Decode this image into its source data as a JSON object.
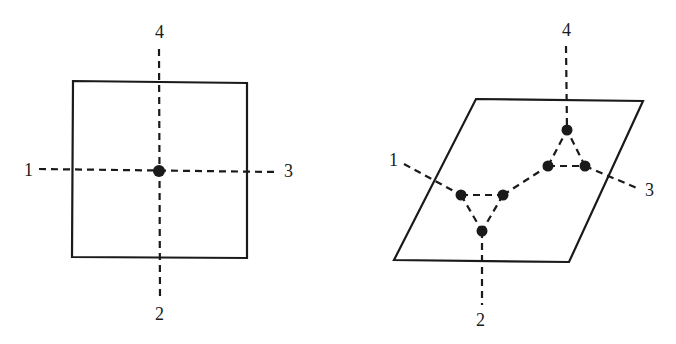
{
  "diagram": {
    "left": {
      "title": "square-with-single-junction",
      "labels": [
        {
          "text": "1",
          "x": 24,
          "y": 176
        },
        {
          "text": "2",
          "x": 155,
          "y": 320
        },
        {
          "text": "3",
          "x": 284,
          "y": 177
        },
        {
          "text": "4",
          "x": 155,
          "y": 38
        }
      ],
      "node_count": 1
    },
    "right": {
      "title": "parallelogram-with-two-triangle-junctions",
      "labels": [
        {
          "text": "1",
          "x": 389,
          "y": 166
        },
        {
          "text": "2",
          "x": 476,
          "y": 326
        },
        {
          "text": "3",
          "x": 645,
          "y": 196
        },
        {
          "text": "4",
          "x": 562,
          "y": 36
        }
      ],
      "node_count": 6
    },
    "colors": {
      "ink": "#1a1a1a",
      "background": "#ffffff"
    }
  }
}
